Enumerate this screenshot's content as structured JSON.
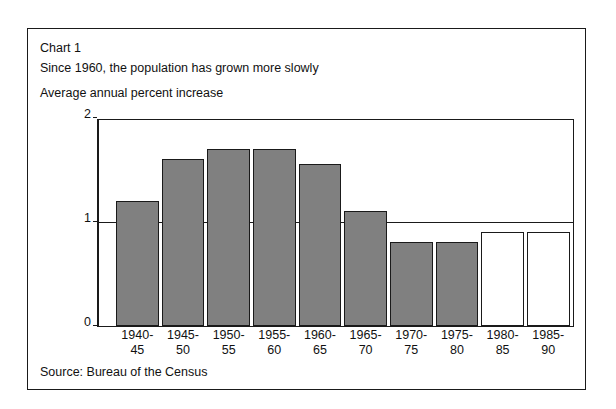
{
  "chart_label": "Chart 1",
  "title": "Since 1960, the population has grown more slowly",
  "axis_title": "Average annual percent increase",
  "source": "Source: Bureau of the Census",
  "colors": {
    "bar_fill": "#808080",
    "bar_projected_fill": "#ffffff",
    "outline": "#1a1a1a",
    "background": "#ffffff"
  },
  "chart_data": {
    "type": "bar",
    "title": "Since 1960, the population has grown more slowly",
    "xlabel": "",
    "ylabel": "Average annual percent increase",
    "ylim": [
      0,
      2
    ],
    "yticks": [
      0,
      1,
      2
    ],
    "ytick_labels": [
      "0",
      "1",
      "2"
    ],
    "grid": true,
    "legend": "none",
    "categories": [
      "1940-45",
      "1945-50",
      "1950-55",
      "1955-60",
      "1960-65",
      "1965-70",
      "1970-75",
      "1975-80",
      "1980-85",
      "1985-90"
    ],
    "category_lines": [
      [
        "1940-",
        "45"
      ],
      [
        "1945-",
        "50"
      ],
      [
        "1950-",
        "55"
      ],
      [
        "1955-",
        "60"
      ],
      [
        "1960-",
        "65"
      ],
      [
        "1965-",
        "70"
      ],
      [
        "1970-",
        "75"
      ],
      [
        "1975-",
        "80"
      ],
      [
        "1980-",
        "85"
      ],
      [
        "1985-",
        "90"
      ]
    ],
    "values": [
      1.2,
      1.6,
      1.7,
      1.7,
      1.55,
      1.1,
      0.8,
      0.8,
      0.9,
      0.9
    ],
    "projected": [
      false,
      false,
      false,
      false,
      false,
      false,
      false,
      false,
      true,
      true
    ]
  }
}
